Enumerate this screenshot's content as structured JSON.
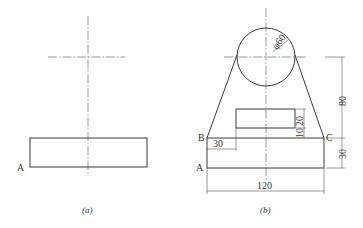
{
  "figure_a": {
    "caption": "(a)",
    "point_labels": {
      "A": "A"
    }
  },
  "figure_b": {
    "caption": "(b)",
    "point_labels": {
      "A": "A",
      "B": "B",
      "C": "C"
    },
    "dimensions": {
      "circle_diameter": "φ60",
      "height_top": "80",
      "height_base": "30",
      "width_total": "120",
      "offset_left": "30",
      "slot_height": "20",
      "slot_gap": "10"
    }
  }
}
